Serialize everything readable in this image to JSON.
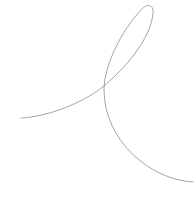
{
  "figure": {
    "width": 196,
    "height": 203,
    "background": "#ffffff",
    "curve": {
      "description": "single thin looping stroke",
      "stroke": "#9a9a9a",
      "stroke_width": 0.9,
      "path": "M21,118 C45,117 80,105 104,86 C125,68 150,40 153,14 C154,4 147,3 141,10 C122,30 104,65 104,90 C104,140 150,180 193,182"
    }
  }
}
